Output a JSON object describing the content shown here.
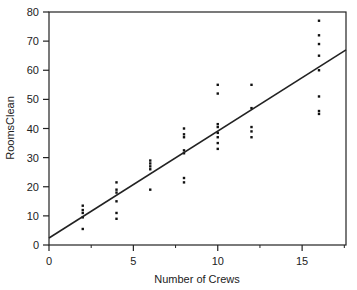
{
  "chart_data": {
    "type": "scatter",
    "title": "",
    "xlabel": "Number of Crews",
    "ylabel": "RoomsClean",
    "xlim": [
      0,
      17.6
    ],
    "ylim": [
      0,
      80
    ],
    "xticks": [
      0,
      5,
      10,
      15
    ],
    "xminor_ticks": [
      2.5,
      7.5,
      12.5,
      17.5
    ],
    "yticks": [
      0,
      10,
      20,
      30,
      40,
      50,
      60,
      70,
      80
    ],
    "grid": false,
    "legend": null,
    "series": [
      {
        "name": "RoomsClean",
        "kind": "points",
        "points": [
          {
            "x": 2,
            "y": 13.5
          },
          {
            "x": 2,
            "y": 12
          },
          {
            "x": 2,
            "y": 11
          },
          {
            "x": 2,
            "y": 9.5
          },
          {
            "x": 2,
            "y": 5.5
          },
          {
            "x": 4,
            "y": 21.5
          },
          {
            "x": 4,
            "y": 19
          },
          {
            "x": 4,
            "y": 18
          },
          {
            "x": 4,
            "y": 15
          },
          {
            "x": 4,
            "y": 11
          },
          {
            "x": 4,
            "y": 9
          },
          {
            "x": 6,
            "y": 29
          },
          {
            "x": 6,
            "y": 28
          },
          {
            "x": 6,
            "y": 27
          },
          {
            "x": 6,
            "y": 26
          },
          {
            "x": 6,
            "y": 19
          },
          {
            "x": 8,
            "y": 40
          },
          {
            "x": 8,
            "y": 38
          },
          {
            "x": 8,
            "y": 37
          },
          {
            "x": 8,
            "y": 32.5
          },
          {
            "x": 8,
            "y": 31.5
          },
          {
            "x": 8,
            "y": 23
          },
          {
            "x": 8,
            "y": 21.5
          },
          {
            "x": 10,
            "y": 55
          },
          {
            "x": 10,
            "y": 52
          },
          {
            "x": 10,
            "y": 41.5
          },
          {
            "x": 10,
            "y": 40.5
          },
          {
            "x": 10,
            "y": 38.5
          },
          {
            "x": 10,
            "y": 37
          },
          {
            "x": 10,
            "y": 35
          },
          {
            "x": 10,
            "y": 33
          },
          {
            "x": 12,
            "y": 55
          },
          {
            "x": 12,
            "y": 47
          },
          {
            "x": 12,
            "y": 40.5
          },
          {
            "x": 12,
            "y": 39
          },
          {
            "x": 12,
            "y": 37
          },
          {
            "x": 16,
            "y": 77
          },
          {
            "x": 16,
            "y": 72
          },
          {
            "x": 16,
            "y": 69
          },
          {
            "x": 16,
            "y": 65
          },
          {
            "x": 16,
            "y": 60
          },
          {
            "x": 16,
            "y": 51
          },
          {
            "x": 16,
            "y": 46
          },
          {
            "x": 16,
            "y": 45
          }
        ]
      },
      {
        "name": "Fitted line",
        "kind": "line",
        "intercept": 2.4,
        "slope": 3.67,
        "x": [
          0,
          17.6
        ],
        "y": [
          2.4,
          67
        ]
      }
    ]
  },
  "labels": {
    "xlabel": "Number of Crews",
    "ylabel": "RoomsClean"
  },
  "colors": {
    "points": "#111111",
    "line": "#222222",
    "axis": "#222222"
  }
}
